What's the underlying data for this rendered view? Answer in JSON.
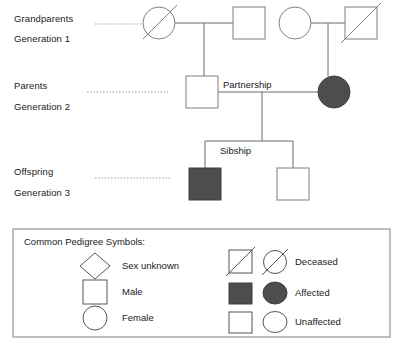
{
  "diagram": {
    "title_visible": false,
    "colors": {
      "line": "#6b6b6b",
      "stroke": "#808080",
      "affected_fill": "#4d4d4d",
      "unaffected_fill": "#ffffff",
      "text": "#1a1a1a",
      "legend_border": "#808080"
    },
    "generations": [
      {
        "id": "generation-1",
        "role_label": "Grandparents",
        "number_label": "Generation 1"
      },
      {
        "id": "generation-2",
        "role_label": "Parents",
        "number_label": "Generation 2"
      },
      {
        "id": "generation-3",
        "role_label": "Offspring",
        "number_label": "Generation 3"
      }
    ],
    "annotations": {
      "partnership": "Partnership",
      "sibship": "Sibship"
    },
    "individuals": [
      {
        "id": "gp-maternal-female",
        "generation": 1,
        "sex": "female",
        "shape": "circle",
        "affected": false,
        "deceased": true
      },
      {
        "id": "gp-maternal-male",
        "generation": 1,
        "sex": "male",
        "shape": "square",
        "affected": false,
        "deceased": false
      },
      {
        "id": "gp-paternal-female",
        "generation": 1,
        "sex": "female",
        "shape": "circle",
        "affected": false,
        "deceased": false
      },
      {
        "id": "gp-paternal-male",
        "generation": 1,
        "sex": "male",
        "shape": "square",
        "affected": false,
        "deceased": true
      },
      {
        "id": "parent-father",
        "generation": 2,
        "sex": "male",
        "shape": "square",
        "affected": false,
        "deceased": false
      },
      {
        "id": "parent-mother",
        "generation": 2,
        "sex": "female",
        "shape": "circle",
        "affected": true,
        "deceased": false
      },
      {
        "id": "child-affected-male",
        "generation": 3,
        "sex": "male",
        "shape": "square",
        "affected": true,
        "deceased": false
      },
      {
        "id": "child-unaffected-male",
        "generation": 3,
        "sex": "male",
        "shape": "square",
        "affected": false,
        "deceased": false
      }
    ]
  },
  "legend": {
    "title": "Common Pedigree Symbols:",
    "left_items": [
      {
        "id": "sex-unknown",
        "shape": "diamond",
        "label": "Sex unknown"
      },
      {
        "id": "male",
        "shape": "square",
        "label": "Male"
      },
      {
        "id": "female",
        "shape": "circle",
        "label": "Female"
      }
    ],
    "right_items": [
      {
        "id": "deceased",
        "shapes": "square-slash,circle-slash",
        "label": "Deceased"
      },
      {
        "id": "affected",
        "shapes": "square-filled,circle-filled",
        "label": "Affected"
      },
      {
        "id": "unaffected",
        "shapes": "square-open,circle-open",
        "label": "Unaffected"
      }
    ]
  }
}
